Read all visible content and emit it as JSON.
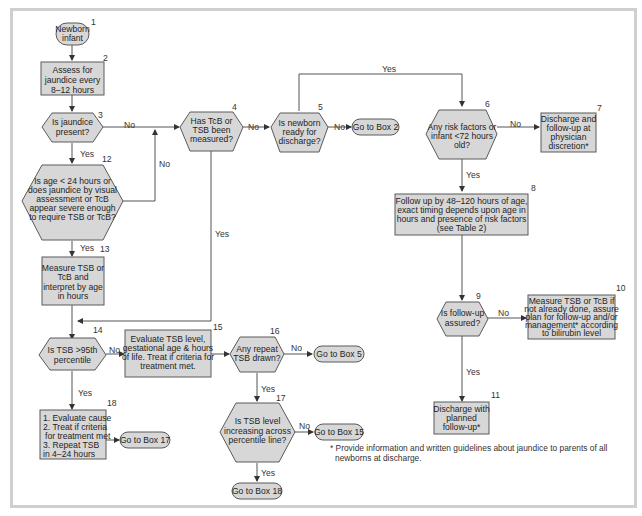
{
  "nodes": {
    "n1": {
      "number": "1",
      "lines": [
        "Newborn",
        "infant"
      ]
    },
    "n2": {
      "number": "2",
      "lines": [
        "Assess for",
        "jaundice every",
        "8–12 hours"
      ]
    },
    "n3": {
      "number": "3",
      "lines": [
        "Is jaundice",
        "present?"
      ]
    },
    "n4": {
      "number": "4",
      "lines": [
        "Has TcB or",
        "TSB been",
        "measured?"
      ]
    },
    "n5": {
      "number": "5",
      "lines": [
        "Is newborn",
        "ready for",
        "discharge?"
      ]
    },
    "n5go": {
      "lines": [
        "Go to Box 2"
      ]
    },
    "n6": {
      "number": "6",
      "lines": [
        "Any risk factors or",
        "infant <72 hours",
        "old?"
      ]
    },
    "n7": {
      "number": "7",
      "lines": [
        "Discharge and",
        "follow-up at",
        "physician",
        "discretion*"
      ]
    },
    "n8": {
      "number": "8",
      "lines": [
        "Follow up by 48–120 hours of age,",
        "exact timing depends upon age in",
        "hours and presence of risk factors",
        "(see Table 2)"
      ]
    },
    "n9": {
      "number": "9",
      "lines": [
        "Is follow-up",
        "assured?"
      ]
    },
    "n10": {
      "number": "10",
      "lines": [
        "Measure TSB or TcB if",
        "not already done, assure",
        "plan for follow-up and/or",
        "management* according",
        "to bilirubin level"
      ]
    },
    "n11": {
      "number": "11",
      "lines": [
        "Discharge with",
        "planned",
        "follow-up*"
      ]
    },
    "n12": {
      "number": "12",
      "lines": [
        "Is age < 24 hours or",
        "does jaundice by visual",
        "assessment or TcB",
        "appear severe enough",
        "to require TSB or TcB?"
      ]
    },
    "n13": {
      "number": "13",
      "lines": [
        "Measure TSB or",
        "TcB and",
        "interpret by age",
        "in hours"
      ]
    },
    "n14": {
      "number": "14",
      "lines": [
        "Is TSB >95th",
        "percentile"
      ]
    },
    "n15": {
      "number": "15",
      "lines": [
        "Evaluate TSB level,",
        "gestational age & hours",
        "of life. Treat if criteria for",
        "treatment met."
      ]
    },
    "n16": {
      "number": "16",
      "lines": [
        "Any repeat",
        "TSB drawn?"
      ]
    },
    "n16go": {
      "lines": [
        "Go to Box 5"
      ]
    },
    "n17": {
      "number": "17",
      "lines": [
        "Is TSB level",
        "increasing across",
        "percentile line?"
      ]
    },
    "n17go_no": {
      "lines": [
        "Go to Box 15"
      ]
    },
    "n17go_yes": {
      "lines": [
        "Go to Box 18"
      ]
    },
    "n18": {
      "number": "18",
      "lines": [
        "1. Evaluate cause",
        "2. Treat if criteria",
        "   for treatment met",
        "3. Repeat TSB",
        "in 4–24 hours"
      ]
    },
    "n18go": {
      "lines": [
        "Go to Box 17"
      ]
    }
  },
  "edge_labels": {
    "yes": "Yes",
    "no": "No"
  },
  "footnote": {
    "lines": [
      "* Provide information and written guidelines about jaundice to parents of all",
      "newborns at discharge."
    ]
  },
  "colors": {
    "shape_fill": "#d7d7d7",
    "shape_stroke": "#5a5a5a",
    "frame": "#cfcfcf",
    "background": "#ffffff"
  }
}
